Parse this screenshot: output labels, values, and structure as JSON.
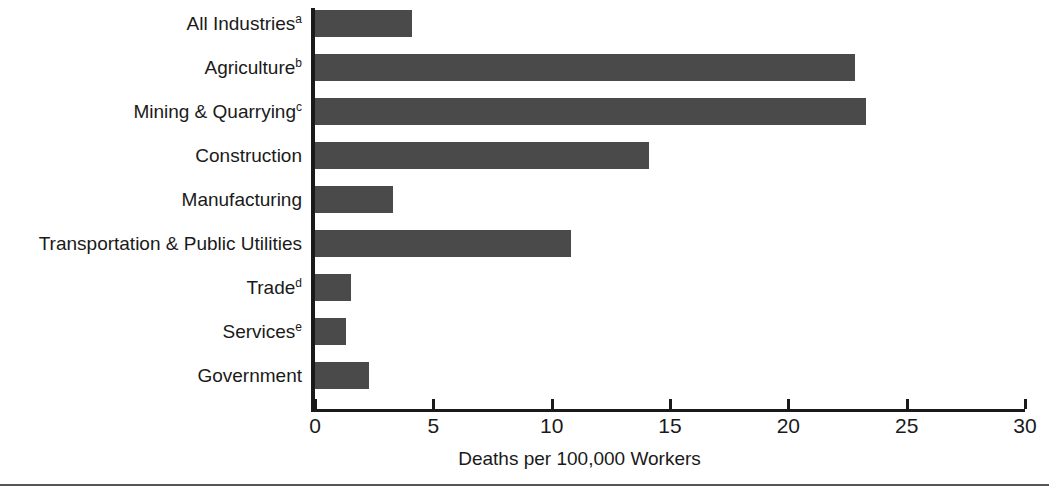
{
  "chart_data": {
    "type": "bar",
    "orientation": "horizontal",
    "title": "",
    "xlabel": "Deaths per 100,000 Workers",
    "ylabel": "",
    "xlim": [
      0,
      30
    ],
    "xticks": [
      0,
      5,
      10,
      15,
      20,
      25,
      30
    ],
    "grid": false,
    "legend": null,
    "bar_color": "#4a4a4a",
    "axis_color": "#1a1a1a",
    "categories": [
      "All Industries",
      "Agriculture",
      "Mining & Quarrying",
      "Construction",
      "Manufacturing",
      "Transportation & Public Utilities",
      "Trade",
      "Services",
      "Government"
    ],
    "category_footnotes": [
      "a",
      "b",
      "c",
      "",
      "",
      "",
      "d",
      "e",
      ""
    ],
    "values": [
      4.1,
      22.8,
      23.3,
      14.1,
      3.3,
      10.8,
      1.5,
      1.3,
      2.3
    ]
  }
}
